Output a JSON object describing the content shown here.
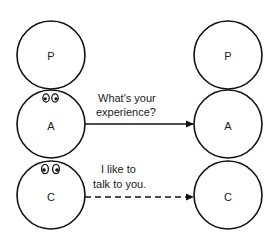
{
  "diagram": {
    "type": "transactional-analysis",
    "left_person": {
      "states": [
        {
          "id": "P",
          "label": "P",
          "cx": 51,
          "cy": 55,
          "eyes": false
        },
        {
          "id": "A",
          "label": "A",
          "cx": 51,
          "cy": 124,
          "eyes": true
        },
        {
          "id": "C",
          "label": "C",
          "cx": 51,
          "cy": 195,
          "eyes": true
        }
      ]
    },
    "right_person": {
      "states": [
        {
          "id": "P",
          "label": "P",
          "cx": 228,
          "cy": 55
        },
        {
          "id": "A",
          "label": "A",
          "cx": 228,
          "cy": 124
        },
        {
          "id": "C",
          "label": "C",
          "cx": 228,
          "cy": 195
        }
      ]
    },
    "radius": 34,
    "transactions": [
      {
        "from": "A",
        "to": "A",
        "style": "solid",
        "line1": "What's your",
        "line2": "experience?"
      },
      {
        "from": "C",
        "to": "C",
        "style": "dashed",
        "line1": "I like to",
        "line2": "talk to you."
      }
    ],
    "colors": {
      "stroke": "#111111",
      "text": "#1a1a1a",
      "background": "#ffffff"
    }
  }
}
